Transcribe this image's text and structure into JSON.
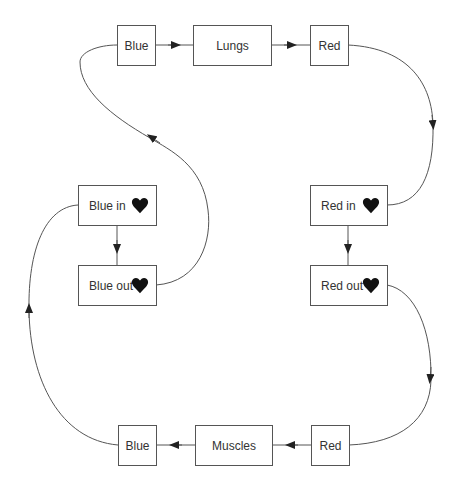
{
  "diagram": {
    "title": "",
    "colors": {
      "line": "#555555",
      "text": "#333333",
      "heart": "#111111",
      "background": "#ffffff"
    },
    "nodes": {
      "top_blue": {
        "label": "Blue"
      },
      "lungs": {
        "label": "Lungs"
      },
      "top_red": {
        "label": "Red"
      },
      "blue_in": {
        "label": "Blue in",
        "icon": "heart-icon"
      },
      "blue_out": {
        "label": "Blue out",
        "icon": "heart-icon"
      },
      "red_in": {
        "label": "Red in",
        "icon": "heart-icon"
      },
      "red_out": {
        "label": "Red out",
        "icon": "heart-icon"
      },
      "bottom_blue": {
        "label": "Blue"
      },
      "muscles": {
        "label": "Muscles"
      },
      "bottom_red": {
        "label": "Red"
      }
    },
    "edges": [
      {
        "from": "Blue",
        "to": "Lungs"
      },
      {
        "from": "Lungs",
        "to": "Red"
      },
      {
        "from": "Red",
        "to": "Red in"
      },
      {
        "from": "Red in",
        "to": "Red out"
      },
      {
        "from": "Red out",
        "to": "Red (bottom)"
      },
      {
        "from": "Red (bottom)",
        "to": "Muscles"
      },
      {
        "from": "Muscles",
        "to": "Blue (bottom)"
      },
      {
        "from": "Blue (bottom)",
        "to": "Blue in"
      },
      {
        "from": "Blue in",
        "to": "Blue out"
      },
      {
        "from": "Blue out",
        "to": "Blue (top)"
      }
    ]
  }
}
